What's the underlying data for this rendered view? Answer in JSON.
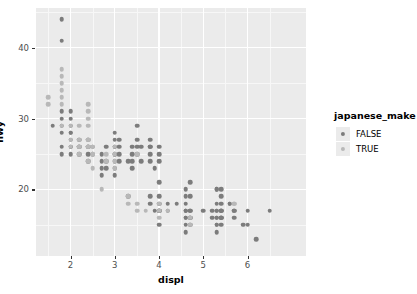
{
  "chart_data": {
    "type": "scatter",
    "title": "",
    "xlabel": "displ",
    "ylabel": "hwy",
    "xlim": [
      1.22,
      7.32
    ],
    "ylim": [
      10.6,
      45.6
    ],
    "x_ticks": [
      2,
      3,
      4,
      5,
      6
    ],
    "y_ticks": [
      20,
      30,
      40
    ],
    "x_tick_labels": [
      "2",
      "3",
      "4",
      "5",
      "6"
    ],
    "y_tick_labels": [
      "20",
      "30",
      "40"
    ],
    "grid": true,
    "panel_background": "#ebebeb",
    "grid_color": "#ffffff",
    "legend": {
      "title": "japanese_make",
      "position": "right",
      "entries": [
        {
          "label": "FALSE",
          "color": "#7c7c7c",
          "value": false
        },
        {
          "label": "TRUE",
          "color": "#b8b8b8",
          "value": true
        }
      ]
    },
    "series": [
      {
        "name": "FALSE",
        "color": "#7c7c7c",
        "points": [
          [
            1.8,
            44
          ],
          [
            1.8,
            41
          ],
          [
            1.6,
            29
          ],
          [
            1.8,
            31
          ],
          [
            1.8,
            30
          ],
          [
            1.8,
            29
          ],
          [
            1.8,
            28
          ],
          [
            1.8,
            26
          ],
          [
            1.8,
            25
          ],
          [
            2.0,
            31
          ],
          [
            2.0,
            30
          ],
          [
            2.0,
            29
          ],
          [
            2.0,
            28
          ],
          [
            2.0,
            28
          ],
          [
            2.0,
            27
          ],
          [
            2.0,
            26
          ],
          [
            2.0,
            26
          ],
          [
            2.0,
            25
          ],
          [
            2.2,
            27
          ],
          [
            2.2,
            26
          ],
          [
            2.2,
            26
          ],
          [
            2.2,
            25
          ],
          [
            2.4,
            27
          ],
          [
            2.4,
            26
          ],
          [
            2.4,
            26
          ],
          [
            2.4,
            25
          ],
          [
            2.4,
            24
          ],
          [
            2.5,
            26
          ],
          [
            2.5,
            25
          ],
          [
            2.7,
            25
          ],
          [
            2.7,
            24
          ],
          [
            2.7,
            23
          ],
          [
            2.7,
            22
          ],
          [
            2.8,
            26
          ],
          [
            2.8,
            24
          ],
          [
            2.8,
            23
          ],
          [
            3.0,
            28
          ],
          [
            3.0,
            27
          ],
          [
            3.0,
            26
          ],
          [
            3.0,
            26
          ],
          [
            3.0,
            25
          ],
          [
            3.0,
            25
          ],
          [
            3.0,
            24
          ],
          [
            3.0,
            23
          ],
          [
            3.0,
            22
          ],
          [
            3.1,
            27
          ],
          [
            3.1,
            26
          ],
          [
            3.1,
            25
          ],
          [
            3.1,
            24
          ],
          [
            3.3,
            24
          ],
          [
            3.3,
            19
          ],
          [
            3.4,
            26
          ],
          [
            3.4,
            25
          ],
          [
            3.4,
            24
          ],
          [
            3.4,
            23
          ],
          [
            3.5,
            29
          ],
          [
            3.5,
            27
          ],
          [
            3.5,
            26
          ],
          [
            3.5,
            25
          ],
          [
            3.6,
            26
          ],
          [
            3.6,
            24
          ],
          [
            3.8,
            27
          ],
          [
            3.8,
            26
          ],
          [
            3.8,
            26
          ],
          [
            3.8,
            25
          ],
          [
            3.8,
            24
          ],
          [
            3.8,
            19
          ],
          [
            3.8,
            18
          ],
          [
            3.9,
            23
          ],
          [
            3.9,
            17
          ],
          [
            4.0,
            26
          ],
          [
            4.0,
            25
          ],
          [
            4.0,
            24
          ],
          [
            4.0,
            21
          ],
          [
            4.0,
            19
          ],
          [
            4.0,
            18
          ],
          [
            4.0,
            17
          ],
          [
            4.0,
            17
          ],
          [
            4.0,
            17
          ],
          [
            4.0,
            15
          ],
          [
            4.2,
            18
          ],
          [
            4.2,
            17
          ],
          [
            4.4,
            18
          ],
          [
            4.6,
            20
          ],
          [
            4.6,
            19
          ],
          [
            4.6,
            18
          ],
          [
            4.6,
            17
          ],
          [
            4.6,
            17
          ],
          [
            4.6,
            17
          ],
          [
            4.6,
            16
          ],
          [
            4.6,
            16
          ],
          [
            4.6,
            15
          ],
          [
            4.6,
            14
          ],
          [
            4.7,
            21
          ],
          [
            4.7,
            19
          ],
          [
            4.7,
            17
          ],
          [
            4.7,
            17
          ],
          [
            4.7,
            16
          ],
          [
            4.7,
            16
          ],
          [
            4.7,
            15
          ],
          [
            5.0,
            17
          ],
          [
            5.2,
            17
          ],
          [
            5.2,
            16
          ],
          [
            5.3,
            20
          ],
          [
            5.3,
            20
          ],
          [
            5.3,
            18
          ],
          [
            5.3,
            17
          ],
          [
            5.3,
            17
          ],
          [
            5.3,
            16
          ],
          [
            5.3,
            16
          ],
          [
            5.3,
            15
          ],
          [
            5.3,
            15
          ],
          [
            5.3,
            14
          ],
          [
            5.4,
            20
          ],
          [
            5.4,
            19
          ],
          [
            5.4,
            18
          ],
          [
            5.4,
            17
          ],
          [
            5.4,
            17
          ],
          [
            5.4,
            17
          ],
          [
            5.4,
            16
          ],
          [
            5.4,
            16
          ],
          [
            5.4,
            16
          ],
          [
            5.4,
            15
          ],
          [
            5.6,
            18
          ],
          [
            5.6,
            18
          ],
          [
            5.7,
            17
          ],
          [
            5.7,
            17
          ],
          [
            5.7,
            16
          ],
          [
            5.9,
            15
          ],
          [
            6.0,
            17
          ],
          [
            6.0,
            15
          ],
          [
            6.2,
            13
          ],
          [
            6.5,
            17
          ]
        ]
      },
      {
        "name": "TRUE",
        "color": "#b8b8b8",
        "points": [
          [
            1.5,
            33
          ],
          [
            1.5,
            32
          ],
          [
            1.8,
            37
          ],
          [
            1.8,
            36
          ],
          [
            1.8,
            35
          ],
          [
            1.8,
            34
          ],
          [
            1.8,
            33
          ],
          [
            1.8,
            32
          ],
          [
            1.8,
            29
          ],
          [
            2.0,
            29
          ],
          [
            2.0,
            27
          ],
          [
            2.0,
            26
          ],
          [
            2.2,
            29
          ],
          [
            2.2,
            27
          ],
          [
            2.2,
            26
          ],
          [
            2.2,
            26
          ],
          [
            2.2,
            25
          ],
          [
            2.4,
            32
          ],
          [
            2.4,
            31
          ],
          [
            2.4,
            30
          ],
          [
            2.4,
            29
          ],
          [
            2.4,
            27
          ],
          [
            2.4,
            27
          ],
          [
            2.4,
            26
          ],
          [
            2.4,
            26
          ],
          [
            2.4,
            24
          ],
          [
            2.5,
            26
          ],
          [
            2.5,
            25
          ],
          [
            2.5,
            25
          ],
          [
            2.5,
            23
          ],
          [
            2.5,
            26
          ],
          [
            2.7,
            20
          ],
          [
            2.8,
            25
          ],
          [
            2.8,
            24
          ],
          [
            3.0,
            26
          ],
          [
            3.0,
            25
          ],
          [
            3.0,
            24
          ],
          [
            3.0,
            23
          ],
          [
            3.3,
            19
          ],
          [
            3.3,
            18
          ],
          [
            3.5,
            25
          ],
          [
            3.5,
            18
          ],
          [
            3.5,
            17
          ],
          [
            3.7,
            17
          ],
          [
            4.0,
            18
          ],
          [
            4.0,
            17
          ],
          [
            4.0,
            16
          ],
          [
            4.2,
            17
          ],
          [
            4.7,
            16
          ],
          [
            4.7,
            15
          ],
          [
            5.7,
            18
          ],
          [
            5.7,
            18
          ]
        ]
      }
    ]
  }
}
